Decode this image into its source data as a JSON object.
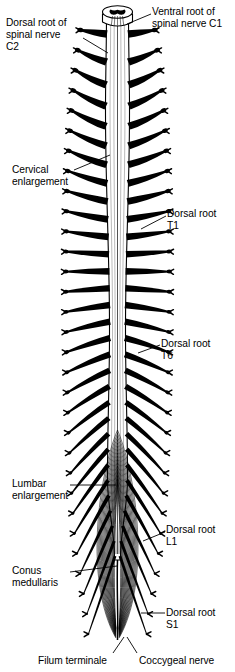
{
  "figure": {
    "background": "#ffffff",
    "ink": "#000000"
  },
  "labels": [
    {
      "id": "dorsal-root-c2",
      "text": "Dorsal root of\nspinal nerve\nC2",
      "x": 6,
      "y": 17,
      "align": "left"
    },
    {
      "id": "ventral-root-c1",
      "text": "Ventral root of\nspinal nerve C1",
      "x": 152,
      "y": 6,
      "align": "left"
    },
    {
      "id": "cervical-enlargement",
      "text": "Cervical\nenlargement",
      "x": 12,
      "y": 164,
      "align": "left"
    },
    {
      "id": "dorsal-root-t1",
      "text": "Dorsal root\nT1",
      "x": 167,
      "y": 208,
      "align": "left"
    },
    {
      "id": "dorsal-root-t6",
      "text": "Dorsal root\nT6",
      "x": 161,
      "y": 338,
      "align": "left"
    },
    {
      "id": "lumbar-enlargement",
      "text": "Lumbar\nenlargement",
      "x": 12,
      "y": 478,
      "align": "left"
    },
    {
      "id": "dorsal-root-l1",
      "text": "Dorsal root\nL1",
      "x": 166,
      "y": 524,
      "align": "left"
    },
    {
      "id": "conus-medullaris",
      "text": "Conus\nmedullaris",
      "x": 12,
      "y": 565,
      "align": "left"
    },
    {
      "id": "dorsal-root-s1",
      "text": "Dorsal root\nS1",
      "x": 166,
      "y": 607,
      "align": "left"
    },
    {
      "id": "filum-terminale",
      "text": "Filum terminale",
      "x": 38,
      "y": 655,
      "align": "left"
    },
    {
      "id": "coccygeal-nerve",
      "text": "Coccygeal nerve",
      "x": 139,
      "y": 655,
      "align": "left"
    }
  ],
  "leaders": [
    {
      "id": "leader-dorsal-root-c2",
      "from": [
        83,
        38
      ],
      "to": [
        108,
        53
      ]
    },
    {
      "id": "leader-ventral-root-c1",
      "from": [
        151,
        14
      ],
      "to": [
        127,
        24
      ]
    },
    {
      "id": "leader-cervical-enlargement",
      "from": [
        74,
        170
      ],
      "to": [
        110,
        155
      ]
    },
    {
      "id": "leader-dorsal-root-t1",
      "from": [
        166,
        216
      ],
      "to": [
        141,
        229
      ]
    },
    {
      "id": "leader-dorsal-root-t6",
      "from": [
        160,
        345
      ],
      "to": [
        138,
        353
      ]
    },
    {
      "id": "leader-lumbar-enlargement",
      "from": [
        70,
        485
      ],
      "to": [
        116,
        485
      ]
    },
    {
      "id": "leader-dorsal-root-l1",
      "from": [
        165,
        532
      ],
      "to": [
        143,
        541
      ]
    },
    {
      "id": "leader-conus-medullaris",
      "from": [
        70,
        572
      ],
      "to": [
        117,
        566
      ]
    },
    {
      "id": "leader-dorsal-root-s1",
      "from": [
        165,
        613
      ],
      "to": [
        141,
        613
      ]
    },
    {
      "id": "leader-filum-terminale",
      "from": [
        113,
        653
      ],
      "to": [
        124,
        637
      ]
    },
    {
      "id": "leader-coccygeal-nerve",
      "from": [
        137,
        653
      ],
      "to": [
        127,
        637
      ]
    }
  ],
  "anatomy": {
    "cord": {
      "top_y": 12,
      "bottom_y": 560,
      "center_x": 117.5,
      "segments": [
        {
          "name": "medulla-stump",
          "y": 12,
          "half_width": 11
        },
        {
          "name": "cervical-enlargement",
          "y": 110,
          "half_width": 12
        },
        {
          "name": "thoracic",
          "y": 330,
          "half_width": 8
        },
        {
          "name": "lumbar-enlargement",
          "y": 478,
          "half_width": 10
        },
        {
          "name": "conus-medullaris",
          "y": 560,
          "half_width": 3
        }
      ]
    },
    "root_pairs_count": 31,
    "cauda_equina_filaments": 34,
    "filum_terminale_tip_y": 640
  }
}
